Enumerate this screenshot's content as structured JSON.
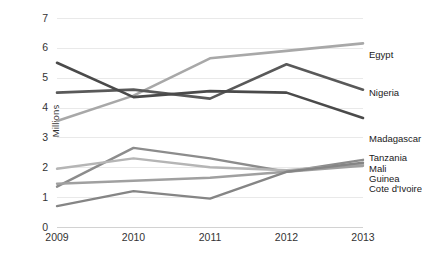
{
  "chart_data": {
    "type": "line",
    "title": "",
    "subtitle": "",
    "xlabel": "",
    "ylabel": "Millions",
    "categories": [
      "2009",
      "2010",
      "2011",
      "2012",
      "2013"
    ],
    "x": [
      2009,
      2010,
      2011,
      2012,
      2013
    ],
    "xlim": [
      2009,
      2013
    ],
    "ylim": [
      0,
      7
    ],
    "yticks": [
      "0",
      "1",
      "2",
      "3",
      "4",
      "5",
      "6",
      "7"
    ],
    "ytick_values": [
      0,
      1,
      2,
      3,
      4,
      5,
      6,
      7
    ],
    "grid": true,
    "legend": "right-end-labels",
    "series": [
      {
        "name": "Egypt",
        "values": [
          3.55,
          4.4,
          5.65,
          5.9,
          6.15
        ],
        "color": "#a8a8a8",
        "width": 2.6
      },
      {
        "name": "Nigeria",
        "values": [
          4.5,
          4.6,
          4.3,
          5.45,
          4.6
        ],
        "color": "#595959",
        "width": 2.6
      },
      {
        "name": "Madagascar",
        "values": [
          5.5,
          4.35,
          4.55,
          4.5,
          3.65
        ],
        "color": "#4a4a4a",
        "width": 2.6
      },
      {
        "name": "Tanzania",
        "values": [
          1.35,
          2.65,
          2.3,
          1.85,
          2.25
        ],
        "color": "#8c8c8c",
        "width": 2.4
      },
      {
        "name": "Mali",
        "values": [
          1.95,
          2.3,
          2.0,
          1.9,
          2.1
        ],
        "color": "#b5b5b5",
        "width": 2.4
      },
      {
        "name": "Guinea",
        "values": [
          1.45,
          1.55,
          1.65,
          1.85,
          2.05
        ],
        "color": "#a0a0a0",
        "width": 2.4
      },
      {
        "name": "Cote d'Ivoire",
        "values": [
          0.7,
          1.2,
          0.95,
          1.85,
          2.15
        ],
        "color": "#858585",
        "width": 2.4
      }
    ],
    "end_labels": [
      {
        "text": "Egypt",
        "y_value": 5.75
      },
      {
        "text": "Nigeria",
        "y_value": 4.5
      },
      {
        "text": "Madagascar",
        "y_value": 2.95
      },
      {
        "text": "Tanzania",
        "y_value": 2.3
      },
      {
        "text": "Mali",
        "y_value": 1.95
      },
      {
        "text": "Guinea",
        "y_value": 1.62
      },
      {
        "text": "Cote d'Ivoire",
        "y_value": 1.28
      }
    ]
  },
  "axis": {
    "y_title": "Millions"
  },
  "style": {
    "background": "#ffffff",
    "gridline_color": "#e9e9e9",
    "axis_color": "#d2d2d2",
    "text_color": "#333333"
  }
}
